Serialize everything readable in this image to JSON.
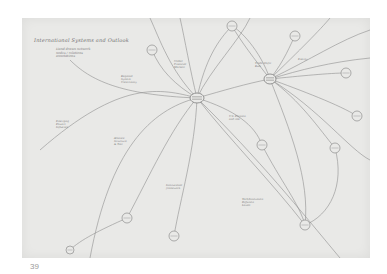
{
  "document": {
    "title": "International Systems and Outlook",
    "subtitle_lines": [
      "Hand drawn network",
      "nodes / relations",
      "annotations"
    ],
    "page_number": "39"
  },
  "colors": {
    "paper": "#e9e9e7",
    "ink": "#8a8a8a",
    "page_background": "#ffffff"
  },
  "diagram": {
    "hubs": [
      {
        "id": "central-hub",
        "x": 197,
        "y": 98,
        "rx": 7,
        "ry": 5
      },
      {
        "id": "right-hub",
        "x": 270,
        "y": 79,
        "rx": 6,
        "ry": 5
      }
    ],
    "nodes": [
      {
        "id": "n-top-left-circle",
        "x": 152,
        "y": 50,
        "r": 5
      },
      {
        "id": "n-top-circle",
        "x": 232,
        "y": 26,
        "r": 5
      },
      {
        "id": "n-top-right-circle",
        "x": 295,
        "y": 36,
        "r": 5
      },
      {
        "id": "n-right-1",
        "x": 346,
        "y": 73,
        "r": 5
      },
      {
        "id": "n-right-2",
        "x": 357,
        "y": 116,
        "r": 5
      },
      {
        "id": "n-right-3",
        "x": 335,
        "y": 148,
        "r": 5
      },
      {
        "id": "n-mid-right",
        "x": 262,
        "y": 145,
        "r": 5
      },
      {
        "id": "n-lower-left",
        "x": 127,
        "y": 218,
        "r": 5
      },
      {
        "id": "n-lower-mid",
        "x": 174,
        "y": 236,
        "r": 5
      },
      {
        "id": "n-lower-right",
        "x": 305,
        "y": 225,
        "r": 5
      },
      {
        "id": "n-bottom-left",
        "x": 70,
        "y": 250,
        "r": 4
      }
    ],
    "labels": [
      {
        "text": "Regional\nSystem\nUncertainty",
        "x": 121,
        "y": 75
      },
      {
        "text": "Global\nFinancial\nMarkets",
        "x": 174,
        "y": 60
      },
      {
        "text": "U.S. Position\nand role",
        "x": 229,
        "y": 115
      },
      {
        "text": "Emerging\nPowers\nInfluence",
        "x": 56,
        "y": 120
      },
      {
        "text": "Alliance\nStructure\n& Ties",
        "x": 114,
        "y": 137
      },
      {
        "text": "Institutional\nframework",
        "x": 166,
        "y": 184
      },
      {
        "text": "Tech/Innovation\nDiffusion\nLevels",
        "x": 242,
        "y": 198
      },
      {
        "text": "Energy",
        "x": 298,
        "y": 58
      },
      {
        "text": "Trade Shifts\nRule",
        "x": 255,
        "y": 62
      }
    ],
    "edges": [
      "M197,98 C170,70 160,40 150,18",
      "M197,98 C205,60 218,40 232,26",
      "M197,98 C210,70 240,40 250,18",
      "M197,98 C160,88 120,80 40,150",
      "M197,98 C150,110 110,150 90,258",
      "M197,98 C170,130 150,175 127,218",
      "M197,98 C195,150 180,200 174,236",
      "M197,98 C235,110 255,125 262,145",
      "M197,98 C230,140 270,180 305,225",
      "M197,98 C260,160 300,210 340,258",
      "M197,98 C225,90 245,84 270,79",
      "M197,98 C190,70 185,40 180,18",
      "M197,98 C120,95 90,80 70,60",
      "M270,79 C300,70 330,62 370,58",
      "M270,79 C300,76 330,73 346,73",
      "M270,79 C300,90 340,105 357,116",
      "M270,79 C300,100 320,130 335,148",
      "M270,79 C310,60 340,40 370,30",
      "M270,79 C300,50 320,30 330,18",
      "M270,79 C285,60 290,45 295,36",
      "M270,79 C260,50 240,30 232,26",
      "M270,79 C320,110 350,150 370,160",
      "M270,79 C290,130 310,180 305,225",
      "M335,148 C345,185 330,215 305,225",
      "M127,218 C100,230 80,240 70,250",
      "M152,50 C160,70 175,85 197,98",
      "M232,26 C240,40 255,60 270,79",
      "M262,145 C280,180 300,205 305,225"
    ]
  }
}
